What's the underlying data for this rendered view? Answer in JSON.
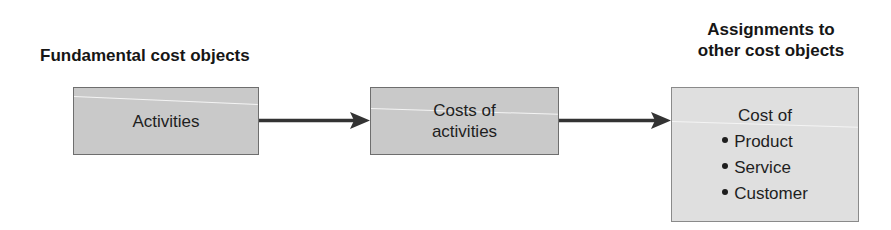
{
  "diagram": {
    "headings": {
      "left": "Fundamental cost objects",
      "right": "Assignments to\nother cost objects"
    },
    "boxes": [
      {
        "id": "activities",
        "label": "Activities",
        "fill": "#c9c9c9"
      },
      {
        "id": "costs-of-activities",
        "label": "Costs of\nactivities",
        "fill": "#c9c9c9"
      },
      {
        "id": "cost-of",
        "label": "Cost of",
        "fill": "#dfdfdf",
        "items": [
          "Product",
          "Service",
          "Customer"
        ]
      }
    ],
    "edges": [
      {
        "from": "activities",
        "to": "costs-of-activities"
      },
      {
        "from": "costs-of-activities",
        "to": "cost-of"
      }
    ],
    "colors": {
      "arrow": "#333333",
      "border": "#6e6e6e"
    }
  }
}
